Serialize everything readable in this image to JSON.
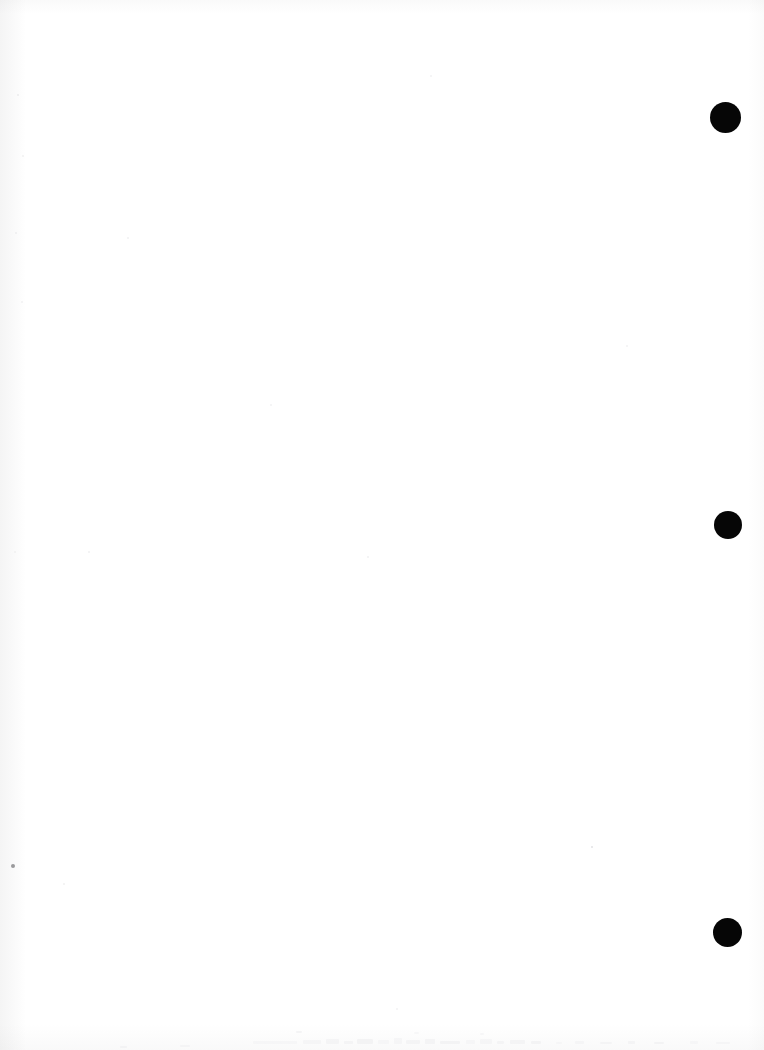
{
  "page": {
    "kind": "scanned-document-page",
    "width": 764,
    "height": 1050,
    "background_color": "#ffffff",
    "paper_tone": "#fefefe",
    "content_summary": "Blank scanned page with three solid black circular marks in the right margin",
    "visible_text": ""
  },
  "marks": {
    "label": "right-margin circular marks",
    "color": "#060606",
    "count": 3,
    "items": [
      {
        "id": "mark-1",
        "cx": 725,
        "cy": 117,
        "diameter": 31
      },
      {
        "id": "mark-2",
        "cx": 728,
        "cy": 525,
        "diameter": 28
      },
      {
        "id": "mark-3",
        "cx": 727,
        "cy": 932,
        "diameter": 29
      }
    ]
  },
  "artifacts": {
    "label": "scanner specks",
    "specks": [
      {
        "id": "speck-left-margin",
        "x": 11,
        "y": 864,
        "size": 4,
        "color": "#9a9a9c"
      },
      {
        "id": "speck-mid-right",
        "x": 591,
        "y": 846,
        "size": 2,
        "color": "#e2e2e4"
      },
      {
        "id": "speck-upper-left",
        "x": 17,
        "y": 94,
        "size": 2,
        "color": "#ededee"
      },
      {
        "id": "speck-upper-left-2",
        "x": 22,
        "y": 155,
        "size": 2,
        "color": "#f0f0f1"
      },
      {
        "id": "speck-left-upper",
        "x": 15,
        "y": 232,
        "size": 2,
        "color": "#eeeeef"
      },
      {
        "id": "speck-left-mid",
        "x": 21,
        "y": 301,
        "size": 2,
        "color": "#f1f1f2"
      },
      {
        "id": "speck-left-lower",
        "x": 14,
        "y": 551,
        "size": 2,
        "color": "#f0f0f1"
      },
      {
        "id": "speck-center-upper",
        "x": 127,
        "y": 237,
        "size": 2,
        "color": "#f1f1f2"
      },
      {
        "id": "speck-center",
        "x": 270,
        "y": 404,
        "size": 2,
        "color": "#f2f2f3"
      },
      {
        "id": "speck-center-low",
        "x": 88,
        "y": 551,
        "size": 2,
        "color": "#f1f1f2"
      },
      {
        "id": "speck-right-upper",
        "x": 430,
        "y": 75,
        "size": 2,
        "color": "#f2f2f3"
      },
      {
        "id": "speck-right-mid",
        "x": 367,
        "y": 556,
        "size": 2,
        "color": "#f1f1f2"
      },
      {
        "id": "speck-right-low",
        "x": 626,
        "y": 345,
        "size": 2,
        "color": "#f2f2f3"
      },
      {
        "id": "speck-bottom-left",
        "x": 63,
        "y": 883,
        "size": 2,
        "color": "#f0f0f1"
      },
      {
        "id": "speck-bottom-mid",
        "x": 396,
        "y": 1008,
        "size": 2,
        "color": "#f2f2f3"
      }
    ],
    "bottom_edge_remnant": {
      "id": "cut-off-text-line",
      "description": "faint top edge of a cut-off line of printed text",
      "x": 238,
      "y": 1038,
      "width": 300,
      "height": 12,
      "color": "#e9e9ea"
    }
  }
}
